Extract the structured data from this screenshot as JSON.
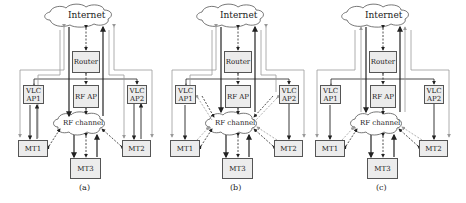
{
  "figure": {
    "panels": [
      {
        "id": "a",
        "caption": "(a)",
        "internet_label": "Internet",
        "router_label": "Router",
        "rf_ap_label": "RF AP",
        "rf_channel_label": "RF channel",
        "vlc_ap1_label": [
          "VLC",
          "AP1"
        ],
        "vlc_ap2_label": [
          "VLC",
          "AP2"
        ],
        "mt1_label": "MT1",
        "mt2_label": "MT2",
        "mt3_label": "MT3",
        "variant": "vlc-downlink-vlc-uplink"
      },
      {
        "id": "b",
        "caption": "(b)",
        "internet_label": "Internet",
        "router_label": "Router",
        "rf_ap_label": "RF AP",
        "rf_channel_label": "RF channel",
        "vlc_ap1_label": [
          "VLC",
          "AP1"
        ],
        "vlc_ap2_label": [
          "VLC",
          "AP2"
        ],
        "mt1_label": "MT1",
        "mt2_label": "MT2",
        "mt3_label": "MT3",
        "variant": "vlc-downlink-rf-uplink-via-ap"
      },
      {
        "id": "c",
        "caption": "(c)",
        "internet_label": "Internet",
        "router_label": "Router",
        "rf_ap_label": "RF AP",
        "rf_channel_label": "RF channel",
        "vlc_ap1_label": [
          "VLC",
          "AP1"
        ],
        "vlc_ap2_label": [
          "VLC",
          "AP2"
        ],
        "mt1_label": "MT1",
        "mt2_label": "MT2",
        "mt3_label": "MT3",
        "variant": "vlc-downlink-rf-uplink"
      }
    ],
    "colors": {
      "box_fill": "#ececec",
      "box_border": "#555555",
      "dark_line": "#222222",
      "gray_line": "#999999"
    }
  }
}
